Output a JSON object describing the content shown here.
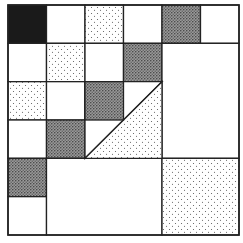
{
  "diagram": {
    "title": "",
    "grid": {
      "cols": 6,
      "rows": 6,
      "origin": [
        8,
        5
      ],
      "size": [
        231,
        230
      ]
    },
    "colors": {
      "black": "#1a1a1a",
      "line": "#222222",
      "light_dot": "#555555",
      "dark_dot": "#333333",
      "background": "#ffffff"
    },
    "cells": [
      {
        "c": 0,
        "r": 0,
        "w": 1,
        "h": 1,
        "fill": "black"
      },
      {
        "c": 1,
        "r": 0,
        "w": 1,
        "h": 1,
        "fill": "white"
      },
      {
        "c": 2,
        "r": 0,
        "w": 1,
        "h": 1,
        "fill": "light"
      },
      {
        "c": 3,
        "r": 0,
        "w": 1,
        "h": 1,
        "fill": "white"
      },
      {
        "c": 4,
        "r": 0,
        "w": 1,
        "h": 1,
        "fill": "dark"
      },
      {
        "c": 5,
        "r": 0,
        "w": 1,
        "h": 1,
        "fill": "white"
      },
      {
        "c": 0,
        "r": 1,
        "w": 1,
        "h": 1,
        "fill": "white"
      },
      {
        "c": 1,
        "r": 1,
        "w": 1,
        "h": 1,
        "fill": "light"
      },
      {
        "c": 2,
        "r": 1,
        "w": 1,
        "h": 1,
        "fill": "white"
      },
      {
        "c": 3,
        "r": 1,
        "w": 1,
        "h": 1,
        "fill": "dark"
      },
      {
        "c": 4,
        "r": 1,
        "w": 2,
        "h": 3,
        "fill": "white"
      },
      {
        "c": 0,
        "r": 2,
        "w": 1,
        "h": 1,
        "fill": "light"
      },
      {
        "c": 1,
        "r": 2,
        "w": 1,
        "h": 1,
        "fill": "white"
      },
      {
        "c": 2,
        "r": 2,
        "w": 1,
        "h": 1,
        "fill": "dark"
      },
      {
        "c": 0,
        "r": 3,
        "w": 1,
        "h": 1,
        "fill": "white"
      },
      {
        "c": 1,
        "r": 3,
        "w": 1,
        "h": 1,
        "fill": "dark"
      },
      {
        "c": 0,
        "r": 4,
        "w": 1,
        "h": 1,
        "fill": "dark"
      },
      {
        "c": 0,
        "r": 5,
        "w": 1,
        "h": 1,
        "fill": "white"
      },
      {
        "c": 1,
        "r": 4,
        "w": 3,
        "h": 2,
        "fill": "white"
      },
      {
        "c": 4,
        "r": 4,
        "w": 2,
        "h": 2,
        "fill": "light"
      }
    ],
    "triangle": {
      "region": {
        "c": 2,
        "r": 2,
        "w": 2,
        "h": 2
      },
      "diagonal": "bottom-left to top-right",
      "lower_fill": "light",
      "upper_fill": "white"
    }
  }
}
